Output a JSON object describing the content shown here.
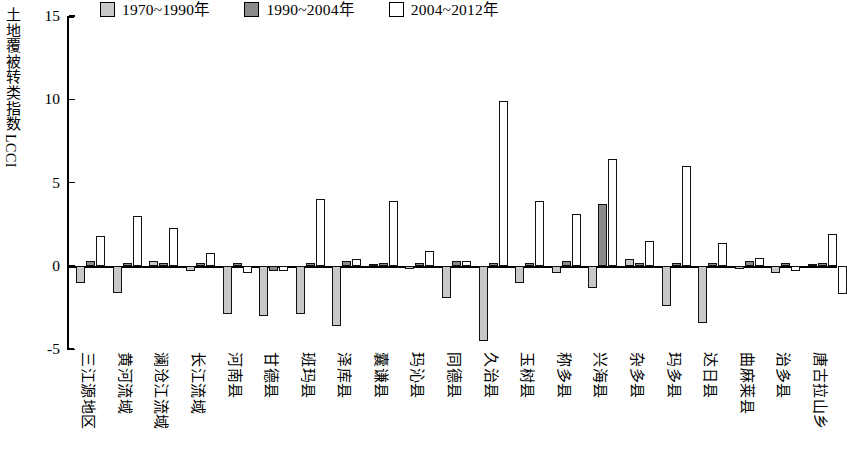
{
  "chart_data": {
    "type": "bar",
    "title": "",
    "xlabel": "",
    "ylabel": "土地覆被转类指数LCCI",
    "ylabel_cjk": "土地覆被转类指数",
    "ylabel_latin": "LCCI",
    "ylim": [
      -5,
      15
    ],
    "yticks": [
      -5,
      0,
      5,
      10,
      15
    ],
    "ytick_labels": [
      "-5",
      "0",
      "5",
      "10",
      "15"
    ],
    "grid": false,
    "legend_position": "top",
    "zero_line": true,
    "categories": [
      "三江源地区",
      "黄河流域",
      "澜沧江流域",
      "长江流域",
      "河南县",
      "甘德县",
      "班玛县",
      "泽库县",
      "囊谦县",
      "玛沁县",
      "同德县",
      "久治县",
      "玉树县",
      "称多县",
      "兴海县",
      "杂多县",
      "玛多县",
      "达日县",
      "曲麻莱县",
      "治多县",
      "唐古拉山乡"
    ],
    "series": [
      {
        "name": "1970~1990年",
        "color": "#c8c8c8",
        "values": [
          -1.0,
          -1.6,
          0.3,
          -0.3,
          -2.9,
          -3.0,
          -2.9,
          -3.6,
          0.1,
          -0.2,
          -1.9,
          -4.5,
          -1.0,
          -0.4,
          -1.3,
          0.4,
          -2.4,
          -3.4,
          -0.2,
          -0.4,
          0.1
        ]
      },
      {
        "name": "1990~2004年",
        "color": "#8a8a8a",
        "values": [
          0.3,
          0.2,
          0.2,
          0.2,
          0.2,
          -0.3,
          0.2,
          0.3,
          0.2,
          0.2,
          0.3,
          0.2,
          0.2,
          0.3,
          3.7,
          0.2,
          0.2,
          0.2,
          0.3,
          0.2,
          0.2
        ]
      },
      {
        "name": "2004~2012年",
        "color": "#ffffff",
        "values": [
          1.8,
          3.0,
          2.3,
          0.8,
          -0.4,
          -0.3,
          4.0,
          0.4,
          3.9,
          0.9,
          0.3,
          9.9,
          3.9,
          3.1,
          6.4,
          1.5,
          6.0,
          1.4,
          0.5,
          -0.3,
          1.9
        ]
      }
    ],
    "extra_bars": [
      {
        "category_index": 20,
        "series": "2004~2012年",
        "value": -1.7
      }
    ]
  },
  "legend": {
    "items": [
      {
        "label": "1970~1990年",
        "swatch": "light-gray"
      },
      {
        "label": "1990~2004年",
        "swatch": "dark-gray"
      },
      {
        "label": "2004~2012年",
        "swatch": "white"
      }
    ]
  },
  "axis": {
    "y_title_cjk": "土地覆被转类指数",
    "y_title_latin": "LCCI",
    "y_tick_15": "15",
    "y_tick_10": "10",
    "y_tick_5": "5",
    "y_tick_0": "0",
    "y_tick_neg5": "-5"
  }
}
